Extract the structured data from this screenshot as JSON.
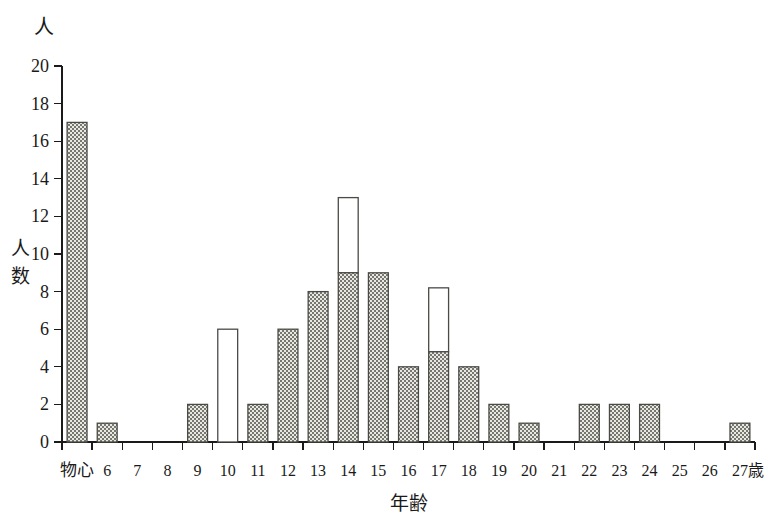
{
  "chart_data": {
    "type": "bar",
    "title": "",
    "subtitle": "",
    "unit_label_top": "人",
    "xlabel": "年齢",
    "ylabel": "人数",
    "x_axis_suffix": "歳",
    "categories": [
      "物心",
      "6",
      "7",
      "8",
      "9",
      "10",
      "11",
      "12",
      "13",
      "14",
      "15",
      "16",
      "17",
      "18",
      "19",
      "20",
      "21",
      "22",
      "23",
      "24",
      "25",
      "26",
      "27"
    ],
    "values": [
      17,
      1,
      0,
      0,
      2,
      6,
      2,
      6,
      8,
      13,
      9,
      4,
      8.2,
      4,
      2,
      1,
      0,
      2,
      2,
      2,
      0,
      0,
      1
    ],
    "series": [
      {
        "name": "filled",
        "values": [
          17,
          1,
          0,
          0,
          2,
          0,
          2,
          6,
          8,
          9,
          9,
          4,
          4.8,
          4,
          2,
          1,
          0,
          2,
          2,
          2,
          0,
          0,
          1
        ]
      },
      {
        "name": "open",
        "values": [
          0,
          0,
          0,
          0,
          0,
          6,
          0,
          0,
          0,
          4,
          0,
          0,
          3.4,
          0,
          0,
          0,
          0,
          0,
          0,
          0,
          0,
          0,
          0
        ]
      }
    ],
    "ylim": [
      0,
      20
    ],
    "ytick_step": 2,
    "yticks": [
      "0",
      "2",
      "4",
      "6",
      "8",
      "10",
      "12",
      "14",
      "16",
      "18",
      "20"
    ],
    "grid": false,
    "legend": "none",
    "colors": {
      "axis": "#1a1a1a",
      "bar_outline": "#4a4a46",
      "bar_fill_hatch": "#6f6f68",
      "bar_fill_background": "#e8e8e2",
      "bar_open": "#ffffff"
    }
  }
}
